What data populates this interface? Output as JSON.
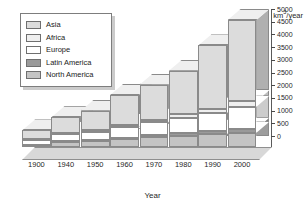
{
  "chart_data": {
    "type": "bar",
    "title": "",
    "subtitle": "",
    "stacked": true,
    "three_d": true,
    "xlabel": "Year",
    "ylabel": "km³/year",
    "categories": [
      "1900",
      "1940",
      "1950",
      "1960",
      "1970",
      "1980",
      "1990",
      "2000"
    ],
    "ylim": [
      0,
      5000
    ],
    "ytick_step": 500,
    "yticks": [
      0,
      500,
      1000,
      1500,
      2000,
      2500,
      3000,
      3500,
      4000,
      4500,
      5000
    ],
    "ytick_labels": [
      "0",
      "500",
      "1000",
      "1500",
      "2000",
      "2500",
      "3000",
      "3500",
      "4000",
      "4500",
      "5000"
    ],
    "grid": false,
    "legend_position": "top-left",
    "axis_side": "right",
    "series": [
      {
        "name": "North America",
        "color": "#c4c4c4",
        "values": [
          70,
          180,
          230,
          300,
          380,
          450,
          500,
          560
        ]
      },
      {
        "name": "Latin America",
        "color": "#9a9a9a",
        "values": [
          20,
          40,
          50,
          70,
          90,
          110,
          135,
          160
        ]
      },
      {
        "name": "Europe",
        "color": "#ffffff",
        "values": [
          200,
          280,
          330,
          420,
          500,
          600,
          700,
          860
        ]
      },
      {
        "name": "Africa",
        "color": "#efefef",
        "values": [
          40,
          50,
          60,
          80,
          100,
          140,
          180,
          220
        ]
      },
      {
        "name": "Asia",
        "color": "#dcdcdc",
        "values": [
          320,
          620,
          760,
          1180,
          1380,
          1700,
          2485,
          3200
        ]
      }
    ],
    "totals": [
      650,
      1170,
      1430,
      2050,
      2450,
      3000,
      4000,
      5000
    ]
  },
  "legend": {
    "items": [
      {
        "label": "Asia",
        "color": "#dcdcdc"
      },
      {
        "label": "Africa",
        "color": "#efefef"
      },
      {
        "label": "Europe",
        "color": "#ffffff"
      },
      {
        "label": "Latin America",
        "color": "#9a9a9a"
      },
      {
        "label": "North America",
        "color": "#c4c4c4"
      }
    ]
  },
  "axes": {
    "y_title_prefix": "km",
    "y_title_sup": "3",
    "y_title_suffix": "/year",
    "x_title": "Year"
  }
}
